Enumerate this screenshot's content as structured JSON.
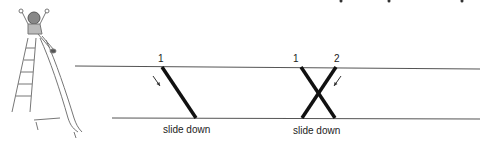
{
  "illustration": {
    "name": "child-on-slide"
  },
  "diagrams": [
    {
      "start_label": "1",
      "caption": "slide down"
    },
    {
      "start_labels": [
        "1",
        "2"
      ],
      "caption": "slide down"
    }
  ],
  "colors": {
    "line": "#555555",
    "stroke": "#111111",
    "text": "#222222"
  }
}
